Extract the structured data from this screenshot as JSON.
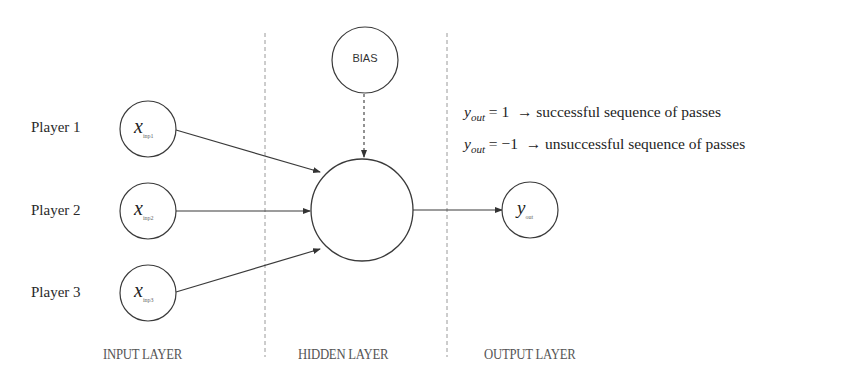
{
  "diagram": {
    "type": "perceptron",
    "players": [
      {
        "label": "Player 1",
        "node_var": "x",
        "node_sub": "inp1"
      },
      {
        "label": "Player 2",
        "node_var": "x",
        "node_sub": "inp2"
      },
      {
        "label": "Player 3",
        "node_var": "x",
        "node_sub": "inp3"
      }
    ],
    "bias_label": "BIAS",
    "output_node": {
      "var": "y",
      "sub": "out"
    },
    "layers": [
      "INPUT LAYER",
      "HIDDEN LAYER",
      "OUTPUT LAYER"
    ],
    "legend": [
      {
        "var": "y",
        "sub": "out",
        "eq": "= 1",
        "arrow": "→",
        "text": "successful sequence of passes"
      },
      {
        "var": "y",
        "sub": "out",
        "eq": "= −1",
        "arrow": "→",
        "text": "unsuccessful sequence of passes"
      }
    ],
    "colors": {
      "stroke": "#3a3a3a",
      "divider": "#9a9a9a",
      "background": "#ffffff"
    }
  }
}
